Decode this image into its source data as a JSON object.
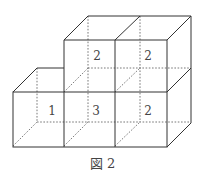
{
  "figure": {
    "caption": "図 2",
    "labels": {
      "top_middle": "2",
      "top_right": "2",
      "bottom_left": "1",
      "bottom_middle": "3",
      "bottom_right": "2"
    },
    "colors": {
      "line": "#333333",
      "text": "#444444",
      "background": "#ffffff"
    }
  }
}
